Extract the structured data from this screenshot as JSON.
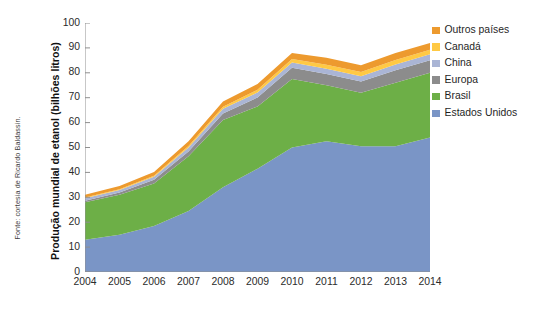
{
  "source_note": "Fonte: cortesia de Ricardo Baldassin.",
  "legend": {
    "items": [
      {
        "label": "Outros países",
        "color": "#ED9A2E"
      },
      {
        "label": "Canadá",
        "color": "#FFC944"
      },
      {
        "label": "China",
        "color": "#AAB5D5"
      },
      {
        "label": "Europa",
        "color": "#8C8C8C"
      },
      {
        "label": "Brasil",
        "color": "#6DAF47"
      },
      {
        "label": "Estados Unidos",
        "color": "#7A95C6"
      }
    ]
  },
  "chart_data": {
    "type": "area",
    "stacked": true,
    "title": "",
    "xlabel": "",
    "ylabel": "Produção mundial de etanol (bilhões litros)",
    "ylim": [
      0,
      100
    ],
    "yticks": [
      0,
      10,
      20,
      30,
      40,
      50,
      60,
      70,
      80,
      90,
      100
    ],
    "grid": false,
    "legend_position": "right",
    "categories": [
      "2004",
      "2005",
      "2006",
      "2007",
      "2008",
      "2009",
      "2010",
      "2011",
      "2012",
      "2013",
      "2014"
    ],
    "x": [
      2004,
      2005,
      2006,
      2007,
      2008,
      2009,
      2010,
      2011,
      2012,
      2013,
      2014
    ],
    "series": [
      {
        "name": "Estados Unidos",
        "color": "#7A95C6",
        "values": [
          13.0,
          15.0,
          18.5,
          24.5,
          34.0,
          41.5,
          50.0,
          52.5,
          50.5,
          50.5,
          54.0
        ]
      },
      {
        "name": "Brasil",
        "color": "#6DAF47",
        "values": [
          15.0,
          16.0,
          17.0,
          22.0,
          27.0,
          25.0,
          27.5,
          22.5,
          21.5,
          25.5,
          26.0
        ]
      },
      {
        "name": "Europa",
        "color": "#8C8C8C",
        "values": [
          0.6,
          0.9,
          1.5,
          1.9,
          2.7,
          3.6,
          4.5,
          4.5,
          4.5,
          5.0,
          5.0
        ]
      },
      {
        "name": "China",
        "color": "#AAB5D5",
        "values": [
          1.0,
          1.0,
          1.3,
          1.6,
          1.9,
          2.0,
          2.1,
          2.1,
          2.1,
          2.3,
          2.5
        ]
      },
      {
        "name": "Canadá",
        "color": "#FFC944",
        "values": [
          0.3,
          0.3,
          0.4,
          0.6,
          0.8,
          1.1,
          1.4,
          1.6,
          1.7,
          1.8,
          1.8
        ]
      },
      {
        "name": "Outros países",
        "color": "#ED9A2E",
        "values": [
          1.1,
          1.3,
          1.5,
          1.9,
          2.1,
          2.3,
          2.5,
          2.8,
          2.7,
          2.9,
          2.7
        ]
      }
    ],
    "totals": [
      31.0,
      34.5,
      40.2,
      52.5,
      68.5,
      75.5,
      88.0,
      86.0,
      83.0,
      88.0,
      92.0
    ]
  }
}
